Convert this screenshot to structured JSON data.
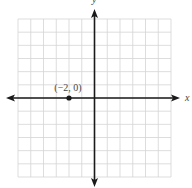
{
  "chart_data": {
    "type": "scatter",
    "title": "",
    "xlabel": "x",
    "ylabel": "y",
    "xlim": [
      -6,
      6
    ],
    "ylim": [
      -6,
      6
    ],
    "grid": true,
    "tick_labels": false,
    "points": [
      {
        "x": -2,
        "y": 0,
        "label": "(−2, 0)"
      }
    ]
  },
  "colors": {
    "grid": "#d4d4d4",
    "axis": "#1a1a1a",
    "point": "#1a1a1a"
  }
}
